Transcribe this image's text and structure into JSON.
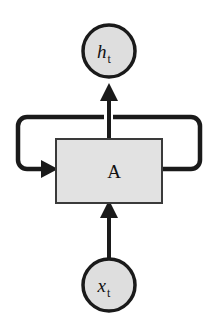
{
  "diagram": {
    "background_color": "#ffffff",
    "stroke_color": "#1a1a1a",
    "node_fill_color": "#dedede",
    "cell_fill_color": "#e2e2e2",
    "nodes": {
      "output": {
        "id": "h_t",
        "symbol": "h",
        "subscript": "t",
        "shape": "circle",
        "cx": 109,
        "cy": 51,
        "r": 26
      },
      "input": {
        "id": "x_t",
        "symbol": "x",
        "subscript": "t",
        "shape": "circle",
        "cx": 109,
        "cy": 285,
        "r": 26
      },
      "cell": {
        "id": "A",
        "label": "A",
        "shape": "rectangle",
        "x": 56,
        "y": 139,
        "width": 106,
        "height": 64
      }
    },
    "edges": [
      {
        "name": "input-to-cell",
        "from": "x_t",
        "to": "A",
        "direction": "up",
        "arrowhead": true
      },
      {
        "name": "cell-to-output",
        "from": "A",
        "to": "h_t",
        "direction": "up",
        "arrowhead": true
      },
      {
        "name": "recurrent-loop",
        "from": "A",
        "to": "A",
        "direction": "right-up-left-down-in",
        "arrowhead": true,
        "top_y": 117,
        "left_x": 18,
        "right_x": 200,
        "entry_y": 169,
        "exit_y": 169,
        "corner_radius": 9
      }
    ]
  }
}
